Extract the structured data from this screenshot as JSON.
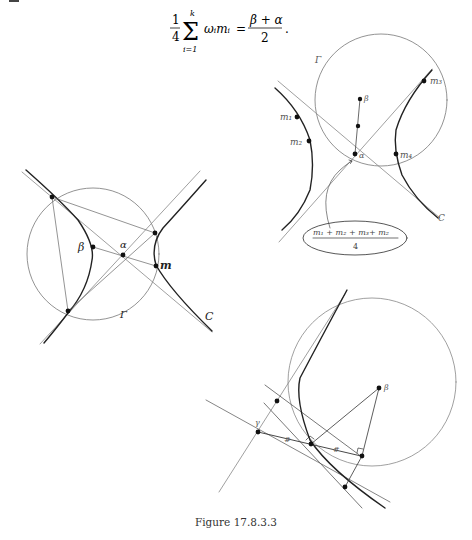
{
  "page": {
    "formula": {
      "left_coefficient_num": "1",
      "left_coefficient_den": "4",
      "sum_upper": "k",
      "sum_lower": "i=1",
      "summand": "ωᵢmᵢ",
      "equals": "=",
      "rhs_num": "β + α",
      "rhs_den": "2",
      "trailing": "."
    },
    "figure_left": {
      "labels": {
        "beta": "β",
        "alpha": "α",
        "m": "m",
        "gamma": "Γ",
        "curve": "C"
      }
    },
    "figure_top_right": {
      "labels": {
        "gamma": "Γ",
        "beta": "β",
        "alpha": "α",
        "m1": "m₁",
        "m2": "m₂",
        "m3": "m₃",
        "m4": "m₄",
        "curve": "C"
      },
      "callout_num": "m₁ + m₂ + m₃+ m₂",
      "callout_den": "4"
    },
    "figure_bottom_right": {
      "labels": {
        "beta": "β",
        "gamma": "γ",
        "equal_mark_1": "#",
        "equal_mark_2": "#"
      }
    },
    "caption": "Figure 17.8.3.3"
  }
}
